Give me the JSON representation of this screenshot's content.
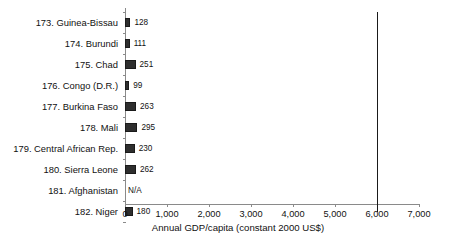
{
  "chart_data": {
    "type": "bar",
    "orientation": "horizontal",
    "title": "",
    "xlabel": "Annual GDP/capita (constant 2000 US$)",
    "ylabel": "",
    "xlim": [
      0,
      7000
    ],
    "xticks": [
      "0",
      "1,000",
      "2,000",
      "3,000",
      "4,000",
      "5,000",
      "6,000",
      "7,000"
    ],
    "xtick_values": [
      0,
      1000,
      2000,
      3000,
      4000,
      5000,
      6000,
      7000
    ],
    "grid": false,
    "legend": "none",
    "categories": [
      "173. Guinea-Bissau",
      "174. Burundi",
      "175. Chad",
      "176. Congo (D.R.)",
      "177. Burkina Faso",
      "178. Mali",
      "179. Central African Rep.",
      "180. Sierra Leone",
      "181. Afghanistan",
      "182. Niger"
    ],
    "values": [
      128,
      111,
      251,
      99,
      263,
      295,
      230,
      262,
      null,
      180
    ],
    "value_labels": [
      "128",
      "111",
      "251",
      "99",
      "263",
      "295",
      "230",
      "262",
      "N/A",
      "180"
    ],
    "annotations": [
      {
        "type": "vertical-reference-line",
        "value": 6000,
        "label": ""
      }
    ]
  },
  "colors": {
    "bar_fill": "#2e2e2e",
    "bar_edge": "#1a1a1a",
    "axis": "#8a8a8a",
    "reference_line": "#1a1a1a",
    "background": "#ffffff",
    "text": "#111111"
  }
}
